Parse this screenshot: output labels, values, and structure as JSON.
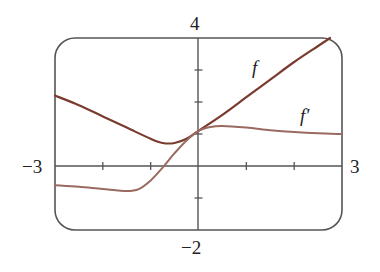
{
  "chart_data": {
    "type": "line",
    "title": "",
    "xlabel": "",
    "ylabel": "",
    "xlim": [
      -3,
      3
    ],
    "ylim": [
      -2,
      4
    ],
    "grid": false,
    "x_ticks": [
      -2,
      -1,
      1,
      2
    ],
    "y_ticks": [
      -1,
      1,
      2,
      3
    ],
    "range_labels": {
      "x_min": "−3",
      "x_max": "3",
      "y_min": "−2",
      "y_max": "4"
    },
    "series": [
      {
        "name": "f",
        "label": "f",
        "color": "#7a3b2e",
        "x": [
          -3,
          -2.5,
          -2,
          -1.5,
          -1,
          -0.75,
          -0.5,
          -0.25,
          0,
          0.5,
          1,
          1.5,
          2,
          2.5,
          2.75
        ],
        "y": [
          2.2,
          1.9,
          1.55,
          1.2,
          0.85,
          0.72,
          0.72,
          0.85,
          1.1,
          1.6,
          2.15,
          2.7,
          3.25,
          3.75,
          4.0
        ]
      },
      {
        "name": "f'",
        "label": "f′",
        "color": "#9a6a60",
        "x": [
          -3,
          -2.5,
          -2,
          -1.5,
          -1.25,
          -1,
          -0.75,
          -0.5,
          -0.25,
          0,
          0.25,
          0.5,
          1,
          1.5,
          2,
          2.5,
          3
        ],
        "y": [
          -0.6,
          -0.65,
          -0.72,
          -0.78,
          -0.72,
          -0.45,
          -0.05,
          0.4,
          0.8,
          1.1,
          1.22,
          1.25,
          1.2,
          1.12,
          1.06,
          1.02,
          1.0
        ]
      }
    ],
    "annotations": [
      {
        "text": "f",
        "x": 1.3,
        "y": 3.6
      },
      {
        "text": "f′",
        "x": 2.3,
        "y": 1.6
      }
    ]
  }
}
